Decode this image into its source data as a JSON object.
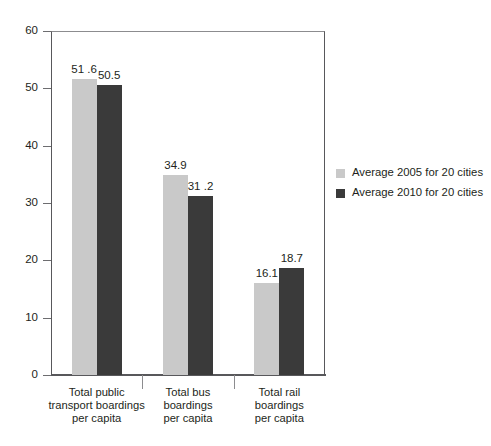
{
  "chart_data": {
    "type": "bar",
    "title": "",
    "subtitle": "",
    "xlabel": "",
    "ylabel": "",
    "ylim": [
      0,
      60
    ],
    "yticks": [
      0,
      10,
      20,
      30,
      40,
      50,
      60
    ],
    "ytick_labels": [
      "0",
      "10",
      "20",
      "30",
      "40",
      "50",
      "60"
    ],
    "grid": true,
    "grid_axis": "y",
    "legend_position": "right",
    "categories": [
      "Total public\ntransport boardings\nper capita",
      "Total bus\nboardings\nper capita",
      "Total rail\nboardings\nper capita"
    ],
    "category_lines": [
      [
        "Total public",
        "transport boardings",
        "per capita"
      ],
      [
        "Total bus",
        "boardings",
        "per capita"
      ],
      [
        "Total rail",
        "boardings",
        "per capita"
      ]
    ],
    "series": [
      {
        "name": "Average 2005 for 20 cities",
        "color": "#c9c9c9",
        "values": [
          51.6,
          34.9,
          16.1
        ],
        "value_labels": [
          "51 .6",
          "34.9",
          "16.1"
        ]
      },
      {
        "name": "Average 2010 for 20 cities",
        "color": "#3a3a3a",
        "values": [
          50.5,
          31.2,
          18.7
        ],
        "value_labels": [
          "50.5",
          "31 .2",
          "18.7"
        ]
      }
    ]
  },
  "legend": {
    "items": [
      {
        "label": "Average 2005 for 20 cities",
        "color": "#c9c9c9"
      },
      {
        "label": "Average 2010 for 20 cities",
        "color": "#3a3a3a"
      }
    ]
  },
  "axis": {
    "y_tick_labels": [
      "60",
      "50",
      "40",
      "30",
      "20",
      "10",
      "0"
    ]
  }
}
